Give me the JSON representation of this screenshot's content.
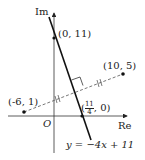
{
  "diagram": {
    "type": "complex-plane",
    "axes": {
      "x_label": "Re",
      "y_label": "Im",
      "origin_label": "O"
    },
    "points": [
      {
        "id": "p1",
        "label": "(0, 11)"
      },
      {
        "id": "p2",
        "label": "(10, 5)"
      },
      {
        "id": "p3",
        "label": "(-6, 1)"
      },
      {
        "id": "p4",
        "label_num": "11",
        "label_den": "4",
        "label_prefix": "(",
        "label_suffix": ", 0)"
      }
    ],
    "line_label": "y = −4x + 11",
    "colors": {
      "stroke": "#222222",
      "dashed": "#555555"
    }
  }
}
